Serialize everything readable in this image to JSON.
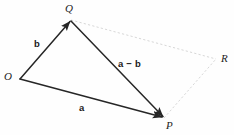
{
  "figure": {
    "background_color": "#fefefe",
    "stroke_color": "#262626",
    "dashed_color": "#d2d2d2",
    "points": {
      "O": {
        "label": "O",
        "x": 20,
        "y": 79
      },
      "Q": {
        "label": "Q",
        "x": 71,
        "y": 20
      },
      "P": {
        "label": "P",
        "x": 164,
        "y": 118
      },
      "R": {
        "label": "R",
        "x": 216,
        "y": 59
      }
    },
    "vectors": {
      "a": {
        "label": "a",
        "from": "O",
        "to": "P",
        "style": "solid",
        "arrow": true
      },
      "b": {
        "label": "b",
        "from": "O",
        "to": "Q",
        "style": "solid",
        "arrow": true
      },
      "a_minus_b": {
        "label": "a − b",
        "from": "Q",
        "to": "P",
        "style": "solid",
        "arrow": true
      }
    },
    "construction_lines": [
      {
        "name": "q-to-r",
        "from": "Q",
        "to": "R",
        "style": "dashed",
        "arrow": false
      },
      {
        "name": "p-to-r",
        "from": "P",
        "to": "R",
        "style": "dashed",
        "arrow": false
      }
    ]
  }
}
